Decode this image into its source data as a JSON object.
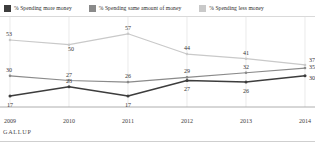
{
  "legend": {
    "items": [
      {
        "label": "% Spending more money",
        "color": "#3d3d3d",
        "key": "more"
      },
      {
        "label": "% Spending same amount of money",
        "color": "#8a8a8a",
        "key": "same"
      },
      {
        "label": "% Spending less money",
        "color": "#c9c9c9",
        "key": "less"
      }
    ]
  },
  "footer": {
    "brand": "GALLUP"
  },
  "chart_data": {
    "type": "line",
    "title": "",
    "subtitle": "",
    "xlabel": "",
    "ylabel": "",
    "categories": [
      "2009",
      "2010",
      "2011",
      "2012",
      "2013",
      "2014"
    ],
    "ylim": [
      10,
      62
    ],
    "grid": "vertical",
    "legend_position": "top",
    "series": [
      {
        "name": "% Spending more money",
        "color": "#3d3d3d",
        "values": [
          17,
          23,
          17,
          27,
          26,
          30
        ],
        "labels": [
          "17",
          "23",
          "17",
          "27",
          "26",
          "30"
        ]
      },
      {
        "name": "% Spending same amount of money",
        "color": "#8a8a8a",
        "values": [
          30,
          27,
          26,
          29,
          32,
          35
        ],
        "labels": [
          "30",
          "27",
          "26",
          "29",
          "32",
          "35"
        ]
      },
      {
        "name": "% Spending less money",
        "color": "#c9c9c9",
        "values": [
          53,
          50,
          57,
          44,
          41,
          37
        ],
        "labels": [
          "53",
          "50",
          "57",
          "44",
          "41",
          "37"
        ]
      }
    ]
  }
}
